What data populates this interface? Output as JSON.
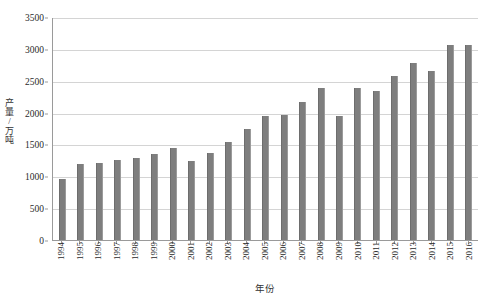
{
  "chart_data": {
    "type": "bar",
    "title": "",
    "xlabel": "年份",
    "ylabel": "产量/万吨",
    "ylim": [
      0,
      3500
    ],
    "ytick_step": 500,
    "yticks": [
      0,
      500,
      1000,
      1500,
      2000,
      2500,
      3000,
      3500
    ],
    "ytick_labels": [
      "0",
      "500",
      "1000",
      "1500",
      "2000",
      "2500",
      "3000",
      "3500"
    ],
    "grid": true,
    "legend": "none",
    "bar_color": "#7e7e7e",
    "categories": [
      "1994",
      "1995",
      "1996",
      "1997",
      "1998",
      "1999",
      "2000",
      "2001",
      "2002",
      "2003",
      "2004",
      "2005",
      "2006",
      "2007",
      "2008",
      "2009",
      "2010",
      "2011",
      "2012",
      "2013",
      "2014",
      "2015",
      "2016"
    ],
    "values": [
      960,
      1200,
      1215,
      1260,
      1285,
      1350,
      1450,
      1235,
      1370,
      1545,
      1750,
      1940,
      1965,
      2160,
      2390,
      1945,
      2385,
      2340,
      2570,
      2780,
      2660,
      3060,
      3055
    ]
  }
}
